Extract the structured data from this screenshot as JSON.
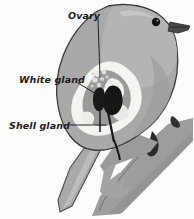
{
  "figure": {
    "background_color": "#fdfdfc"
  },
  "labels": [
    {
      "id": "ovary",
      "text": "Ovary",
      "x": 68,
      "y": 15,
      "leader": "M 98,19 L 100,77"
    },
    {
      "id": "white-gland",
      "text": "White gland",
      "x": 19,
      "y": 79,
      "leader": "M 78,83 L 101,97"
    },
    {
      "id": "shell-gland",
      "text": "Shell gland",
      "x": 9,
      "y": 128,
      "leader": "M 70,125 L 106,125"
    }
  ],
  "palette": {
    "body_gray": "#a9a9a9",
    "body_light": "#c4c4c4",
    "outline": "#3a3a3a",
    "organ_white": "#f4f4f0",
    "organ_mid": "#9a9a9a",
    "gland_dark": "#1a1a1a",
    "branch_gray": "#9d9d9d",
    "branch_dark": "#8a8a8a",
    "beak_dark": "#4a4a4a",
    "eye": "#141414",
    "label_text": "#1c1c1c",
    "leader_stroke": "#111111"
  },
  "anatomy_parts": [
    {
      "id": "bird-body",
      "name": "bird body silhouette"
    },
    {
      "id": "bird-head",
      "name": "bird head"
    },
    {
      "id": "bird-beak",
      "name": "beak"
    },
    {
      "id": "bird-eye",
      "name": "eye"
    },
    {
      "id": "bird-tail",
      "name": "tail feathers"
    },
    {
      "id": "bird-wing",
      "name": "wing"
    },
    {
      "id": "oviduct-region",
      "name": "oviduct region"
    },
    {
      "id": "ovary-mass",
      "name": "ovary follicle cluster"
    },
    {
      "id": "white-gland-mass",
      "name": "white gland (albumen gland)"
    },
    {
      "id": "shell-gland-mass",
      "name": "shell gland (uterus)"
    },
    {
      "id": "perch-branch",
      "name": "perch branch"
    }
  ]
}
